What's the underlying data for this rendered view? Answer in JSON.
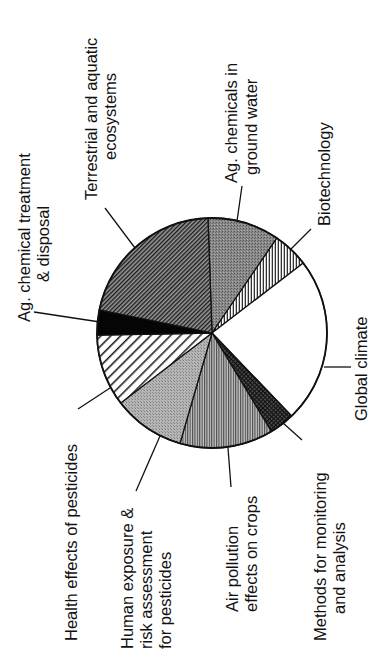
{
  "chart_data": {
    "type": "pie",
    "title": "",
    "orientation": "rotated 90° counter-clockwise (labels read bottom-to-top)",
    "start_angle_deg_from_top_clockwise": 0,
    "slices": [
      {
        "label": "Ag. chemicals in ground water",
        "lines": [
          "Ag. chemicals in",
          "ground water"
        ],
        "value": 10,
        "pattern": "dense-gray-stipple"
      },
      {
        "label": "Biotechnology",
        "lines": [
          "Biotechnology"
        ],
        "value": 5,
        "pattern": "vertical-hatch-light"
      },
      {
        "label": "Global climate",
        "lines": [
          "Global climate"
        ],
        "value": 23,
        "pattern": "white"
      },
      {
        "label": "Methods for monitoring and analysis",
        "lines": [
          "Methods for monitoring",
          "and analysis"
        ],
        "value": 3.5,
        "pattern": "crosshatch-dark"
      },
      {
        "label": "Air pollution effects on crops",
        "lines": [
          "Air pollution",
          "effects on crops"
        ],
        "value": 13,
        "pattern": "horizontal-hatch-gray"
      },
      {
        "label": "Human exposure & risk assessment for pesticides",
        "lines": [
          "Human exposure &",
          "risk assessment",
          "for pesticides"
        ],
        "value": 10,
        "pattern": "light-gray-stipple"
      },
      {
        "label": "Health effects of pesticides",
        "lines": [
          "Health effects of pesticides"
        ],
        "value": 10,
        "pattern": "wide-diagonal-hatch"
      },
      {
        "label": "Ag. chemical treatment & disposal",
        "lines": [
          "Ag. chemical treatment",
          "& disposal"
        ],
        "value": 3.5,
        "pattern": "solid-black"
      },
      {
        "label": "Terrestrial and aquatic ecosystems",
        "lines": [
          "Terrestrial and aquatic",
          "ecosystems"
        ],
        "value": 21,
        "pattern": "dense-diagonal-hatch"
      }
    ],
    "units": "percent (estimated from slice angles)",
    "legend": "none (leader-line labels)"
  }
}
